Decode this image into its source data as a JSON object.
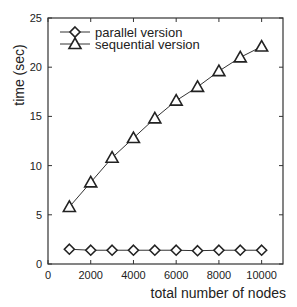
{
  "chart_data": {
    "type": "line",
    "title": "",
    "xlabel": "total number of nodes",
    "ylabel": "time (sec)",
    "xlim": [
      0,
      11000
    ],
    "ylim": [
      0,
      25
    ],
    "xticks": [
      0,
      2000,
      4000,
      6000,
      8000,
      10000
    ],
    "yticks": [
      0,
      5,
      10,
      15,
      20,
      25
    ],
    "grid": false,
    "legend_position": "upper left",
    "x": [
      1000,
      2000,
      3000,
      4000,
      5000,
      6000,
      7000,
      8000,
      9000,
      10000
    ],
    "series": [
      {
        "name": "parallel version",
        "marker": "diamond",
        "values": [
          1.5,
          1.4,
          1.4,
          1.4,
          1.4,
          1.4,
          1.35,
          1.4,
          1.4,
          1.4
        ]
      },
      {
        "name": "sequential version",
        "marker": "triangle",
        "values": [
          5.8,
          8.3,
          10.8,
          12.8,
          14.8,
          16.6,
          18.0,
          19.6,
          21.0,
          22.1
        ]
      }
    ]
  }
}
